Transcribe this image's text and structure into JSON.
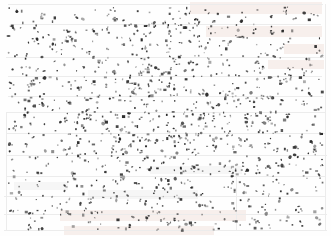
{
  "document": {
    "kind": "scanned-page-noise-field",
    "background_color": "#ffffff",
    "speck_color": "#2b2b2b",
    "ghost_rule_color": "#ececec",
    "ghost_block_warm_color": "#f0e2dc",
    "ghost_block_cool_color": "#eeeeee",
    "width": 331,
    "height": 236,
    "visible_text": "",
    "caption": ""
  },
  "noise": {
    "type": "salt-and-pepper-speckle",
    "seed": 20240517,
    "count": 1180,
    "min_size_px": 1,
    "max_size_px": 3,
    "opacity_min": 0.35,
    "opacity_max": 1.0,
    "margin_left": 8,
    "margin_right": 8,
    "margin_top": 6,
    "margin_bottom": 6,
    "density_bias": {
      "note": "slightly denser toward horizontal center-band and right half",
      "center_x": 0.55,
      "center_y": 0.5,
      "falloff": 0.85
    }
  },
  "ghost_rules_horizontal": [
    {
      "y": 4,
      "x": 8,
      "w": 315
    },
    {
      "y": 24,
      "x": 10,
      "w": 311
    },
    {
      "y": 57,
      "x": 6,
      "w": 318
    },
    {
      "y": 76,
      "x": 8,
      "w": 314
    },
    {
      "y": 96,
      "x": 8,
      "w": 315
    },
    {
      "y": 112,
      "x": 6,
      "w": 320
    },
    {
      "y": 133,
      "x": 6,
      "w": 320
    },
    {
      "y": 155,
      "x": 6,
      "w": 321
    },
    {
      "y": 176,
      "x": 6,
      "w": 320
    },
    {
      "y": 196,
      "x": 4,
      "w": 322
    },
    {
      "y": 214,
      "x": 4,
      "w": 323
    },
    {
      "y": 230,
      "x": 4,
      "w": 323
    }
  ],
  "ghost_rules_vertical": [
    {
      "x": 6,
      "y": 112,
      "h": 118
    },
    {
      "x": 325,
      "y": 4,
      "h": 226
    },
    {
      "x": 236,
      "y": 176,
      "h": 54
    }
  ],
  "ghost_blocks": [
    {
      "x": 190,
      "y": 2,
      "w": 132,
      "h": 12,
      "tone": "warm"
    },
    {
      "x": 206,
      "y": 26,
      "w": 116,
      "h": 11,
      "tone": "warm"
    },
    {
      "x": 284,
      "y": 44,
      "w": 40,
      "h": 10,
      "tone": "warm"
    },
    {
      "x": 268,
      "y": 60,
      "w": 56,
      "h": 9,
      "tone": "warm"
    },
    {
      "x": 60,
      "y": 210,
      "w": 186,
      "h": 11,
      "tone": "warm"
    },
    {
      "x": 64,
      "y": 226,
      "w": 150,
      "h": 9,
      "tone": "warm"
    },
    {
      "x": 88,
      "y": 190,
      "w": 110,
      "h": 9,
      "tone": "cool"
    },
    {
      "x": 150,
      "y": 166,
      "w": 92,
      "h": 8,
      "tone": "cool"
    },
    {
      "x": 14,
      "y": 182,
      "w": 54,
      "h": 8,
      "tone": "cool"
    }
  ]
}
